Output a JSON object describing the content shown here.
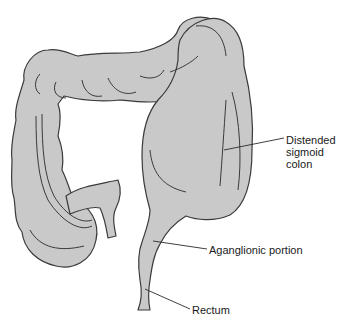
{
  "diagram": {
    "colors": {
      "tissue_fill": "#c9c9c9",
      "outline": "#3a3a3a",
      "leader_line": "#2a2a2a",
      "background": "#ffffff"
    },
    "labels": {
      "sigmoid": {
        "line1": "Distended",
        "line2": "sigmoid",
        "line3": "colon"
      },
      "aganglionic": "Aganglionic portion",
      "rectum": "Rectum"
    }
  }
}
